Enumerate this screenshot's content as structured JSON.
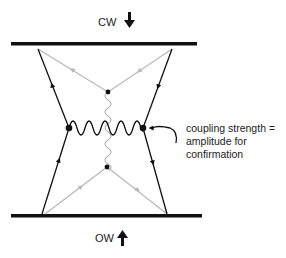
{
  "diagram": {
    "top_label": "CW",
    "bottom_label": "OW",
    "annotation": {
      "lines": [
        "coupling strength =",
        "amplitude for",
        "confirmation"
      ]
    },
    "colors": {
      "primary": "#111111",
      "secondary": "#b8b8b8"
    }
  }
}
